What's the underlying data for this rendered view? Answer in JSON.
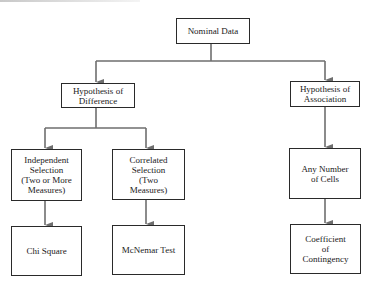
{
  "diagram": {
    "nodes": {
      "root": {
        "label": "Nominal Data"
      },
      "difference": {
        "label": "Hypothesis of\nDifference"
      },
      "association": {
        "label": "Hypothesis of\nAssociation"
      },
      "independent": {
        "label": "Independent\nSelection\n(Two or More\nMeasures)"
      },
      "correlated": {
        "label": "Correlated\nSelection\n(Two\nMeasures)"
      },
      "any_cells": {
        "label": "Any Number\nof Cells"
      },
      "chi_square": {
        "label": "Chi Square"
      },
      "mcnemar": {
        "label": "McNemar Test"
      },
      "contingency": {
        "label": "Coefficient\nof\nContingency"
      }
    },
    "edges": [
      [
        "root",
        "difference"
      ],
      [
        "root",
        "association"
      ],
      [
        "difference",
        "independent"
      ],
      [
        "difference",
        "correlated"
      ],
      [
        "association",
        "any_cells"
      ],
      [
        "independent",
        "chi_square"
      ],
      [
        "correlated",
        "mcnemar"
      ],
      [
        "any_cells",
        "contingency"
      ]
    ],
    "colors": {
      "line": "#6e6e6e",
      "border": "#2a2a2a"
    }
  }
}
